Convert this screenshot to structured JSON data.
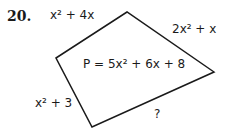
{
  "problem": {
    "number": "20.",
    "perimeter": "P = 5x² + 6x + 8",
    "sides": {
      "top_left": "x² + 4x",
      "top_right": "2x² + x",
      "left": "x² + 3",
      "bottom": "?"
    }
  },
  "shape": {
    "type": "quadrilateral",
    "vertices": [
      [
        56,
        58
      ],
      [
        127,
        12
      ],
      [
        214,
        72
      ],
      [
        92,
        127
      ]
    ],
    "stroke": "#1a1a1a"
  }
}
